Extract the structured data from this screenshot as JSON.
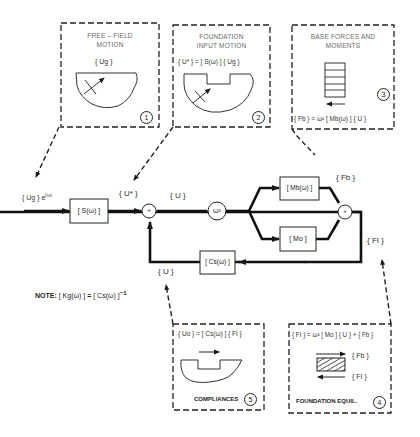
{
  "diagram": {
    "type": "block-diagram",
    "panels": [
      {
        "id": 1,
        "title_line1": "FREE – FIELD",
        "title_line2": "MOTION",
        "equation": "{ Ug }",
        "number": "1"
      },
      {
        "id": 2,
        "title_line1": "FOUNDATION",
        "title_line2": "INPUT MOTION",
        "equation": "{ U* } = [ S(ω) ] { Ug }",
        "number": "2"
      },
      {
        "id": 3,
        "title_line1": "BASE FORCES AND",
        "title_line2": "MOMENTS",
        "equation": "{ Fb } = ω² [ Mb(ω) ] { U }",
        "number": "3"
      },
      {
        "id": 4,
        "title": "FOUNDATION EQUIL.",
        "equation": "{ FI } = ω² [ Mo ] { U } + { Fb }",
        "force_top": "{ Fb }",
        "force_bottom": "{ FI }",
        "number": "4"
      },
      {
        "id": 5,
        "title": "COMPLIANCES",
        "equation": "{ Uo } = [ Cs(ω) ] { FI }",
        "number": "5"
      }
    ],
    "signals": {
      "input": "{ Ug } e",
      "input_exp": "iωt",
      "u_star": "{ U* }",
      "u": "{ U }",
      "u_feedback": "{ U }",
      "fb": "{ Fb }",
      "fi": "{ FI }"
    },
    "blocks": {
      "s": "[ S(ω) ]",
      "gain": "ω²",
      "mb": "[ Mb(ω) ]",
      "mo": "[ Mo ]",
      "cs": "[ Cs(ω) ]",
      "sum_symbol": "+"
    },
    "note": {
      "prefix": "NOTE:",
      "lhs": "[ Kg(ω) ]",
      "eq": "=",
      "rhs": "[ Cs(ω) ]",
      "exp": "−1"
    }
  }
}
